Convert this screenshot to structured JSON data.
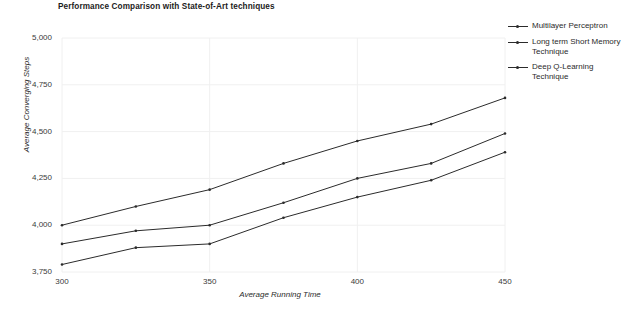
{
  "chart_data": {
    "type": "line",
    "title": "Performance Comparison with State-of-Art techniques",
    "xlabel": "Average Running Time",
    "ylabel": "Average Converging Steps",
    "x": [
      300,
      325,
      350,
      375,
      400,
      425,
      450
    ],
    "xlim": [
      295,
      455
    ],
    "ylim": [
      3700,
      5050
    ],
    "xticks": [
      "300",
      "350",
      "400",
      "450"
    ],
    "xtick_values": [
      300,
      350,
      400,
      450
    ],
    "yticks": [
      "3,750",
      "4,000",
      "4,250",
      "4,500",
      "4,750",
      "5,000"
    ],
    "ytick_values": [
      3750,
      4000,
      4250,
      4500,
      4750,
      5000
    ],
    "grid": "faint vertical and horizontal gridlines",
    "legend_position": "right",
    "series": [
      {
        "name": "Multilayer Perceptron",
        "values": [
          4000,
          4100,
          4190,
          4330,
          4450,
          4540,
          4680
        ]
      },
      {
        "name": "Long term Short Memory Technique",
        "values": [
          3900,
          3970,
          4000,
          4120,
          4250,
          4330,
          4490
        ]
      },
      {
        "name": "Deep Q-Learning Technique",
        "values": [
          3790,
          3880,
          3900,
          4040,
          4150,
          4240,
          4390
        ]
      }
    ]
  },
  "legend": {
    "items": [
      {
        "label": "Multilayer Perceptron"
      },
      {
        "label": "Long term Short Memory Technique"
      },
      {
        "label": "Deep Q-Learning Technique"
      }
    ]
  },
  "colors": {
    "line": "#2b2b2b",
    "grid": "#f0f0f0",
    "text": "#2b2b2b",
    "background": "#ffffff"
  }
}
